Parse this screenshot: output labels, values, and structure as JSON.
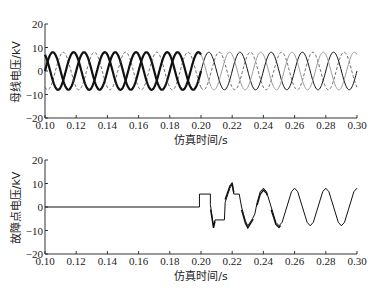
{
  "chart_data": [
    {
      "type": "line",
      "title": "",
      "xlabel": "仿真时间/s",
      "ylabel": "母线电压/kV",
      "xlim": [
        0.1,
        0.3
      ],
      "ylim": [
        -20,
        20
      ],
      "xticks": [
        "0.10",
        "0.12",
        "0.14",
        "0.16",
        "0.18",
        "0.20",
        "0.22",
        "0.24",
        "0.26",
        "0.28",
        "0.30"
      ],
      "yticks": [
        "20",
        "10",
        "0",
        "-10",
        "-20"
      ],
      "grid": false,
      "description": "Three-phase bus voltage, amplitude ~8 kV, 50 Hz; before 0.20 s two phases appear thick/noisy (solid) and one dashed; after 0.20 s all three phases are clean sinusoids (solid dark, dashed, light gray).",
      "series": [
        {
          "name": "Phase A",
          "amplitude": 8,
          "frequency_hz": 50,
          "phase_deg": 0,
          "style": "solid"
        },
        {
          "name": "Phase B",
          "amplitude": 8,
          "frequency_hz": 50,
          "phase_deg": -120,
          "style": "dashed"
        },
        {
          "name": "Phase C",
          "amplitude": 8,
          "frequency_hz": 50,
          "phase_deg": 120,
          "style": "solid-light"
        }
      ]
    },
    {
      "type": "line",
      "title": "",
      "xlabel": "仿真时间/s",
      "ylabel": "故障点电压/kV",
      "xlim": [
        0.1,
        0.3
      ],
      "ylim": [
        -20,
        20
      ],
      "xticks": [
        "0.10",
        "0.12",
        "0.14",
        "0.16",
        "0.18",
        "0.20",
        "0.22",
        "0.24",
        "0.26",
        "0.28",
        "0.30"
      ],
      "yticks": [
        "20",
        "10",
        "0",
        "-10",
        "-20"
      ],
      "grid": false,
      "description": "Fault point voltage: 0 kV until ~0.199 s, step to ~5.5 kV until ~0.206 s, oscillation down to ~-8 at ~0.208, stepped at ~-5.5 kV until ~0.215, then noisy rising sinusoid peaking ~9 at ~0.22, noisy decaying into clean sinusoid amplitude ~8 kV, 50 Hz after ~0.25 s.",
      "series": [
        {
          "name": "Fault point voltage",
          "points": [
            [
              0.1,
              0
            ],
            [
              0.199,
              0
            ],
            [
              0.199,
              5.5
            ],
            [
              0.206,
              5.5
            ],
            [
              0.206,
              1
            ],
            [
              0.208,
              -8
            ],
            [
              0.209,
              -5.5
            ],
            [
              0.215,
              -5.5
            ],
            [
              0.2155,
              2
            ],
            [
              0.2185,
              8
            ],
            [
              0.22,
              9.5
            ],
            [
              0.221,
              5.5
            ],
            [
              0.2245,
              5.5
            ],
            [
              0.226,
              0
            ],
            [
              0.2285,
              -6
            ],
            [
              0.23,
              -8
            ],
            [
              0.232,
              -6
            ],
            [
              0.233,
              -5
            ],
            [
              0.2345,
              -3
            ],
            [
              0.236,
              2
            ],
            [
              0.238,
              6.5
            ],
            [
              0.24,
              8
            ],
            [
              0.242,
              6.5
            ],
            [
              0.245,
              0
            ],
            [
              0.248,
              -6.5
            ],
            [
              0.25,
              -8
            ],
            [
              0.252,
              -6.5
            ],
            [
              0.255,
              0
            ],
            [
              0.258,
              6.5
            ],
            [
              0.26,
              8
            ],
            [
              0.262,
              6.5
            ],
            [
              0.265,
              0
            ],
            [
              0.268,
              -6.5
            ],
            [
              0.27,
              -8
            ],
            [
              0.272,
              -6.5
            ],
            [
              0.275,
              0
            ],
            [
              0.278,
              6.5
            ],
            [
              0.28,
              8
            ],
            [
              0.282,
              6.5
            ],
            [
              0.285,
              0
            ],
            [
              0.288,
              -6.5
            ],
            [
              0.29,
              -8
            ],
            [
              0.292,
              -6.5
            ],
            [
              0.295,
              0
            ],
            [
              0.298,
              6.5
            ],
            [
              0.3,
              8
            ]
          ]
        }
      ]
    }
  ],
  "plots": {
    "top": {
      "ylabel": "母线电压/kV",
      "xlabel": "仿真时间/s"
    },
    "bottom": {
      "ylabel": "故障点电压/kV",
      "xlabel": "仿真时间/s"
    }
  }
}
